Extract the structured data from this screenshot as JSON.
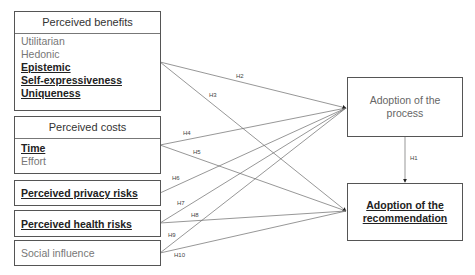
{
  "boxes": {
    "perceived_benefits": {
      "title": "Perceived benefits",
      "items": [
        {
          "label": "Utilitarian",
          "emphasis": false
        },
        {
          "label": "Hedonic",
          "emphasis": false
        },
        {
          "label": "Epistemic",
          "emphasis": true
        },
        {
          "label": "Self-expressiveness",
          "emphasis": true
        },
        {
          "label": "Uniqueness",
          "emphasis": true
        }
      ]
    },
    "perceived_costs": {
      "title": "Perceived costs",
      "items": [
        {
          "label": "Time",
          "emphasis": true
        },
        {
          "label": "Effort",
          "emphasis": false
        }
      ]
    },
    "perceived_privacy_risks": {
      "label": "Perceived privacy risks",
      "emphasis": true
    },
    "perceived_health_risks": {
      "label": "Perceived health risks",
      "emphasis": true
    },
    "social_influence": {
      "label": "Social influence",
      "emphasis": false
    },
    "adoption_process": {
      "label": "Adoption of the process",
      "emphasis": false
    },
    "adoption_recommendation": {
      "label": "Adoption of the recommendation",
      "emphasis": true
    }
  },
  "hypotheses": [
    {
      "id": "H1",
      "from": "adoption_process",
      "to": "adoption_recommendation"
    },
    {
      "id": "H2",
      "from": "perceived_benefits",
      "to": "adoption_process"
    },
    {
      "id": "H3",
      "from": "perceived_benefits",
      "to": "adoption_recommendation"
    },
    {
      "id": "H4",
      "from": "perceived_costs",
      "to": "adoption_process"
    },
    {
      "id": "H5",
      "from": "perceived_costs",
      "to": "adoption_recommendation"
    },
    {
      "id": "H6",
      "from": "perceived_privacy_risks",
      "to": "adoption_process"
    },
    {
      "id": "H7",
      "from": "perceived_health_risks",
      "to": "adoption_process"
    },
    {
      "id": "H8",
      "from": "perceived_health_risks",
      "to": "adoption_recommendation"
    },
    {
      "id": "H9",
      "from": "social_influence",
      "to": "adoption_process"
    },
    {
      "id": "H10",
      "from": "social_influence",
      "to": "adoption_recommendation"
    }
  ],
  "colors": {
    "line": "#6a6a6a",
    "border": "#555555",
    "muted_text": "#777777",
    "strong_text": "#222222"
  }
}
